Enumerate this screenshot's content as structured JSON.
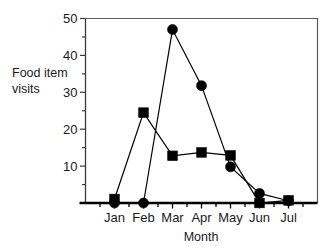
{
  "chart_data": {
    "type": "line",
    "title": "",
    "xlabel": "Month",
    "ylabel": "Food item visits",
    "ylabel_line1": "Food item",
    "ylabel_line2": "visits",
    "categories": [
      "Jan",
      "Feb",
      "Mar",
      "Apr",
      "May",
      "Jun",
      "Jul"
    ],
    "xlim": [
      0,
      8
    ],
    "ylim": [
      0,
      50
    ],
    "yticks": [
      0,
      10,
      20,
      30,
      40,
      50
    ],
    "ytick_labels": [
      "",
      "10",
      "20",
      "30",
      "40",
      "50"
    ],
    "yminor_ticks": [
      5,
      15,
      25,
      35,
      45
    ],
    "grid": false,
    "legend": "none",
    "marker_color": "#000000",
    "line_color": "#000000",
    "frame_color": "#5a5a5a",
    "series": [
      {
        "name": "circle-series",
        "marker": "circle",
        "values": [
          0,
          0,
          47,
          31.8,
          9.8,
          2.6,
          0.6
        ]
      },
      {
        "name": "square-series",
        "marker": "square",
        "values": [
          1.1,
          24.5,
          12.8,
          13.7,
          12.9,
          0,
          0.7
        ]
      }
    ]
  }
}
